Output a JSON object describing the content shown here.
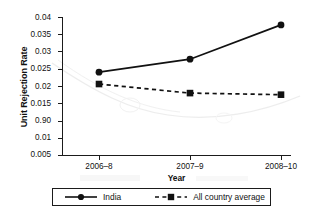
{
  "chart_data": {
    "type": "line",
    "title": "",
    "xlabel": "Year",
    "ylabel": "Unit Rejection Rate",
    "categories": [
      "2006–8",
      "2007–9",
      "2008–10"
    ],
    "x_tick_labels": [
      "2006–8",
      "2007–9",
      "2008–10"
    ],
    "y_tick_labels": [
      "0.04",
      "0.035",
      "0.03",
      "0.025",
      "0.02",
      "0.015",
      "0.90",
      "0.01",
      "0.005"
    ],
    "y_tick_values": [
      0.04,
      0.035,
      0.03,
      0.025,
      0.02,
      0.015,
      0.0125,
      0.01,
      0.005
    ],
    "ylim": [
      0.005,
      0.04
    ],
    "grid": false,
    "legend_position": "bottom",
    "series": [
      {
        "name": "India",
        "values": [
          0.026,
          0.0293,
          0.038
        ],
        "marker": "circle",
        "line_style": "solid",
        "color": "#111111"
      },
      {
        "name": "All country average",
        "values": [
          0.023,
          0.0207,
          0.0203
        ],
        "marker": "square",
        "line_style": "dashed",
        "color": "#111111"
      }
    ]
  },
  "axes": {
    "y_title": "Unit Rejection Rate",
    "x_title": "Year",
    "y_labels": [
      {
        "text": "0.04",
        "top": 14
      },
      {
        "text": "0.035",
        "top": 31
      },
      {
        "text": "0.03",
        "top": 48
      },
      {
        "text": "0.025",
        "top": 65
      },
      {
        "text": "0.02",
        "top": 83
      },
      {
        "text": "0.015",
        "top": 100
      },
      {
        "text": "0.90",
        "top": 117
      },
      {
        "text": "0.01",
        "top": 134
      },
      {
        "text": "0.005",
        "top": 151
      }
    ],
    "x_labels": [
      {
        "text": "2006–8",
        "left": 99
      },
      {
        "text": "2007–9",
        "left": 190
      },
      {
        "text": "2008–10",
        "left": 281
      }
    ]
  },
  "legend": {
    "india_label": "India",
    "avg_label": "All country average"
  },
  "colors": {
    "ink": "#111111",
    "axis": "#1b1b1b",
    "background": "#ffffff",
    "ghost": "#d9d9d9"
  }
}
